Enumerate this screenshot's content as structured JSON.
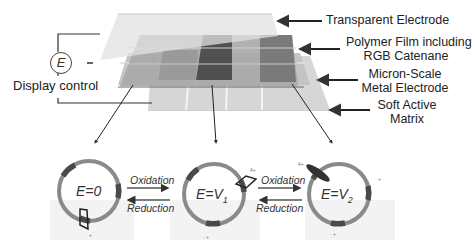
{
  "figure": {
    "type": "electrochromic display layer schematic",
    "layers": [
      {
        "id": "transparent-electrode",
        "label": "Transparent Electrode"
      },
      {
        "id": "polymer-film",
        "label_lines": [
          "Polymer Film including",
          "RGB Catenane"
        ]
      },
      {
        "id": "metal-electrode",
        "label_lines": [
          "Micron-Scale",
          "Metal Electrode"
        ]
      },
      {
        "id": "active-matrix",
        "label_lines": [
          "Soft Active",
          "Matrix"
        ]
      }
    ],
    "control": {
      "symbol": "E",
      "label": "Display control"
    },
    "states": [
      {
        "label": "E=0"
      },
      {
        "label_prefix": "E=V",
        "subscript": "1"
      },
      {
        "label_prefix": "E=V",
        "subscript": "2"
      }
    ],
    "transitions": [
      {
        "forward": "Oxidation",
        "backward": "Reduction"
      },
      {
        "forward": "Oxidation",
        "backward": "Reduction"
      }
    ],
    "charges": {
      "ring4plus": "4+",
      "station": "+",
      "stationB": "· +"
    },
    "colors": {
      "ring": "#8a8a8a",
      "ring_station": "#4a4a4a",
      "layer_top": "#dcdcdc",
      "layer_polymer": "#a9a9a9",
      "layer_dark_pixel": "#4f4f4f",
      "layer_metal": "#c4c4c4",
      "layer_matrix": "#d2d2d2",
      "arrow": "#333333"
    }
  }
}
